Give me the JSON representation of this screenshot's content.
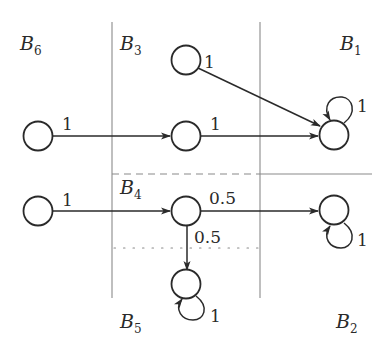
{
  "diagram": {
    "type": "markov-chain-block-partition",
    "blocks": [
      {
        "id": "B6",
        "letter": "B",
        "sub": "6",
        "x": 20,
        "y": 50
      },
      {
        "id": "B3",
        "letter": "B",
        "sub": "3",
        "x": 120,
        "y": 50
      },
      {
        "id": "B1",
        "letter": "B",
        "sub": "1",
        "x": 340,
        "y": 50
      },
      {
        "id": "B4",
        "letter": "B",
        "sub": "4",
        "x": 120,
        "y": 194
      },
      {
        "id": "B5",
        "letter": "B",
        "sub": "5",
        "x": 120,
        "y": 328
      },
      {
        "id": "B2",
        "letter": "B",
        "sub": "2",
        "x": 336,
        "y": 328
      }
    ],
    "nodes": [
      {
        "id": "n1",
        "block": "B3",
        "cx": 186,
        "cy": 60
      },
      {
        "id": "n2",
        "block": "B6",
        "cx": 38,
        "cy": 132
      },
      {
        "id": "n3",
        "block": "B3",
        "cx": 186,
        "cy": 132
      },
      {
        "id": "n4",
        "block": "B1",
        "cx": 334,
        "cy": 133
      },
      {
        "id": "n5",
        "block": "B6",
        "cx": 38,
        "cy": 210
      },
      {
        "id": "n6",
        "block": "B4",
        "cx": 186,
        "cy": 210
      },
      {
        "id": "n7",
        "block": "B2",
        "cx": 334,
        "cy": 212
      },
      {
        "id": "n8",
        "block": "B5",
        "cx": 186,
        "cy": 284
      }
    ],
    "edges": [
      {
        "from": "n1",
        "to": "n4",
        "weight": "1"
      },
      {
        "from": "n2",
        "to": "n3",
        "weight": "1"
      },
      {
        "from": "n3",
        "to": "n4",
        "weight": "1"
      },
      {
        "from": "n4",
        "to": "n4",
        "weight": "1"
      },
      {
        "from": "n5",
        "to": "n6",
        "weight": "1"
      },
      {
        "from": "n6",
        "to": "n7",
        "weight": "0.5"
      },
      {
        "from": "n6",
        "to": "n8",
        "weight": "0.5"
      },
      {
        "from": "n7",
        "to": "n7",
        "weight": "1"
      },
      {
        "from": "n8",
        "to": "n8",
        "weight": "1"
      }
    ],
    "separators": [
      {
        "style": "solid",
        "orientation": "vertical",
        "x": 112,
        "y1": 22,
        "y2": 298
      },
      {
        "style": "solid",
        "orientation": "vertical",
        "x": 260,
        "y1": 22,
        "y2": 298
      },
      {
        "style": "solid",
        "orientation": "horizontal",
        "y": 174,
        "x1": 260,
        "x2": 372
      },
      {
        "style": "dashed",
        "orientation": "horizontal",
        "y": 174,
        "x1": 112,
        "x2": 260
      },
      {
        "style": "dotted",
        "orientation": "horizontal",
        "y": 248,
        "x1": 112,
        "x2": 260
      }
    ],
    "weight_labels": {
      "n1_n4": "1",
      "n2_n3": "1",
      "n3_n4": "1",
      "n4_self": "1",
      "n5_n6": "1",
      "n6_n7": "0.5",
      "n6_n8": "0.5",
      "n7_self": "1",
      "n8_self": "1"
    },
    "block_labels": {
      "B6": "B",
      "B6_sub": "6",
      "B3": "B",
      "B3_sub": "3",
      "B1": "B",
      "B1_sub": "1",
      "B4": "B",
      "B4_sub": "4",
      "B5": "B",
      "B5_sub": "5",
      "B2": "B",
      "B2_sub": "2"
    }
  }
}
